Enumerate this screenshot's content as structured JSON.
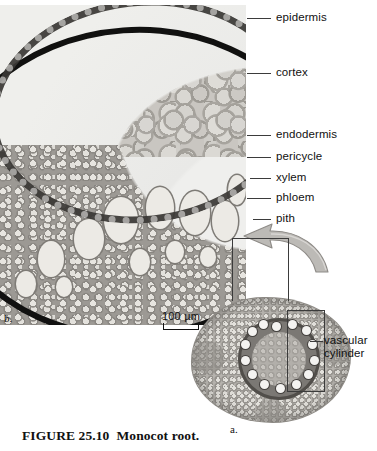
{
  "figure": {
    "number": "FIGURE 25.10",
    "title": "Monocot root.",
    "panel_a_letter": "a.",
    "panel_b_letter": "b."
  },
  "scale_bar": {
    "length_label": "100 µm"
  },
  "callouts": [
    {
      "name": "epidermis",
      "label": "epidermis",
      "top": 11,
      "line_left": 247,
      "line_width": 24
    },
    {
      "name": "cortex",
      "label": "cortex",
      "top": 66,
      "line_left": 247,
      "line_width": 24
    },
    {
      "name": "endodermis",
      "label": "endodermis",
      "top": 128,
      "line_left": 247,
      "line_width": 24
    },
    {
      "name": "pericycle",
      "label": "pericycle",
      "top": 150,
      "line_left": 247,
      "line_width": 24
    },
    {
      "name": "xylem",
      "label": "xylem",
      "top": 171,
      "line_left": 250,
      "line_width": 21
    },
    {
      "name": "phloem",
      "label": "phloem",
      "top": 191,
      "line_left": 247,
      "line_width": 24
    },
    {
      "name": "pith",
      "label": "pith",
      "top": 212,
      "line_left": 253,
      "line_width": 18
    }
  ],
  "vascular_cylinder_label": "vascular cylinder",
  "micrograph_b": {
    "xylem_vessels": [
      {
        "left": 104,
        "top": 192,
        "w": 34,
        "h": 46
      },
      {
        "left": 146,
        "top": 182,
        "w": 28,
        "h": 42
      },
      {
        "left": 180,
        "top": 186,
        "w": 30,
        "h": 44
      },
      {
        "left": 212,
        "top": 196,
        "w": 26,
        "h": 40
      },
      {
        "left": 74,
        "top": 214,
        "w": 30,
        "h": 40
      },
      {
        "left": 38,
        "top": 236,
        "w": 26,
        "h": 36
      },
      {
        "left": 130,
        "top": 244,
        "w": 20,
        "h": 26
      },
      {
        "left": 166,
        "top": 236,
        "w": 18,
        "h": 22
      },
      {
        "left": 200,
        "top": 242,
        "w": 16,
        "h": 20
      },
      {
        "left": 16,
        "top": 266,
        "w": 20,
        "h": 26
      },
      {
        "left": 56,
        "top": 272,
        "w": 16,
        "h": 20
      },
      {
        "left": 228,
        "top": 170,
        "w": 18,
        "h": 30
      }
    ]
  },
  "root_a": {
    "bundles": [
      {
        "left": 34,
        "top": 4
      },
      {
        "left": 50,
        "top": 2
      },
      {
        "left": 64,
        "top": 8
      },
      {
        "left": 70,
        "top": 22
      },
      {
        "left": 72,
        "top": 38
      },
      {
        "left": 66,
        "top": 52
      },
      {
        "left": 54,
        "top": 62
      },
      {
        "left": 38,
        "top": 66
      },
      {
        "left": 22,
        "top": 62
      },
      {
        "left": 10,
        "top": 52
      },
      {
        "left": 3,
        "top": 38
      },
      {
        "left": 3,
        "top": 22
      },
      {
        "left": 10,
        "top": 9
      },
      {
        "left": 21,
        "top": 2
      }
    ]
  },
  "colors": {
    "ink": "#111111",
    "leader": "#3b3b3b",
    "arrow_fill": "#b9b7b3",
    "page": "#ffffff"
  }
}
